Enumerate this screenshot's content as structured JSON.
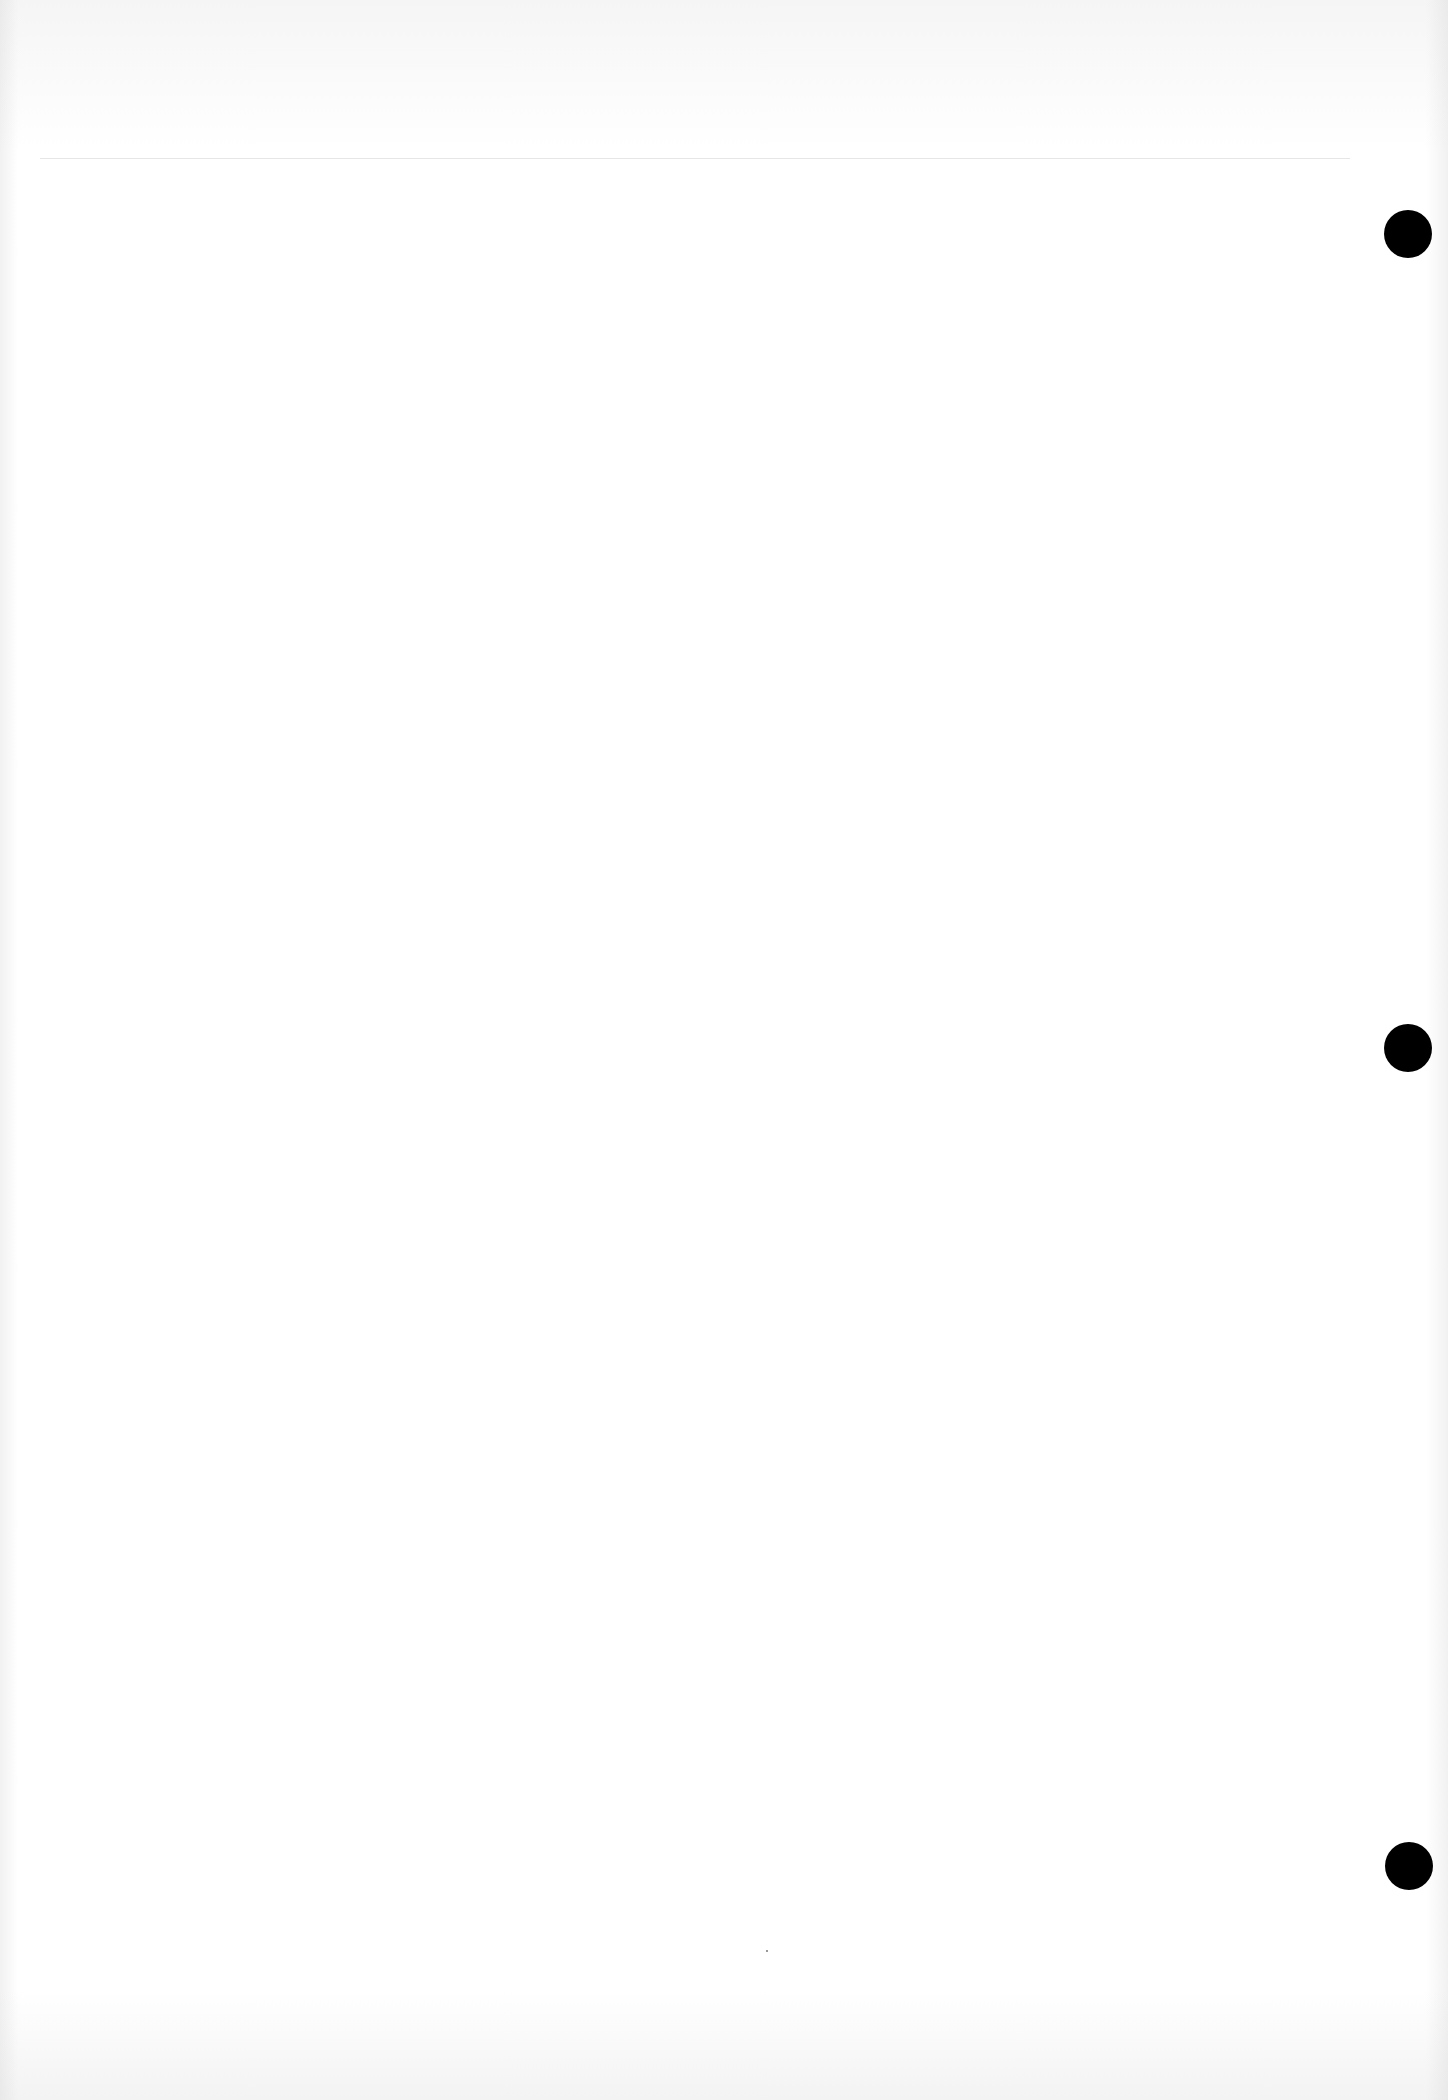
{
  "document": {
    "type": "blank scanned page",
    "text": "",
    "punch_holes": [
      {
        "center_x": 1408,
        "center_y": 234
      },
      {
        "center_x": 1408,
        "center_y": 1048
      },
      {
        "center_x": 1409,
        "center_y": 1866
      }
    ],
    "colors": {
      "paper": "#ffffff",
      "hole": "#000000",
      "rule": "#e6e6e6"
    }
  }
}
